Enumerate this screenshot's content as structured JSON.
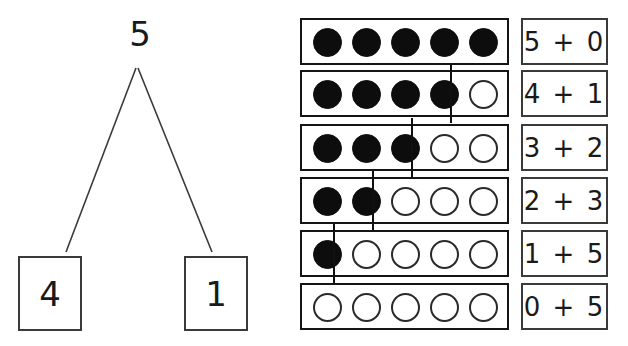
{
  "worksheet": {
    "title": "Number bond and five-frame decompositions of 5",
    "background_color": "#ffffff",
    "ink_color": "#1a1a1a",
    "filled_dot_color": "#0d0d0d",
    "empty_dot_color": "#ffffff"
  },
  "number_bond": {
    "total": "5",
    "part_left": "4",
    "part_right": "1"
  },
  "frames": {
    "dots_per_row": 5,
    "rows": [
      {
        "filled": 5,
        "empty": 0,
        "divider_after": null,
        "expression": "5 + 0",
        "addend_left": "5",
        "operator": "+",
        "addend_right": "0"
      },
      {
        "filled": 4,
        "empty": 1,
        "divider_after": 4,
        "expression": "4 + 1",
        "addend_left": "4",
        "operator": "+",
        "addend_right": "1"
      },
      {
        "filled": 3,
        "empty": 2,
        "divider_after": 3,
        "expression": "3 + 2",
        "addend_left": "3",
        "operator": "+",
        "addend_right": "2"
      },
      {
        "filled": 2,
        "empty": 3,
        "divider_after": 2,
        "expression": "2 + 3",
        "addend_left": "2",
        "operator": "+",
        "addend_right": "3"
      },
      {
        "filled": 1,
        "empty": 4,
        "divider_after": 1,
        "expression": "1 + 5",
        "addend_left": "1",
        "operator": "+",
        "addend_right": "5"
      },
      {
        "filled": 0,
        "empty": 5,
        "divider_after": null,
        "expression": "0 + 5",
        "addend_left": "0",
        "operator": "+",
        "addend_right": "5"
      }
    ]
  }
}
